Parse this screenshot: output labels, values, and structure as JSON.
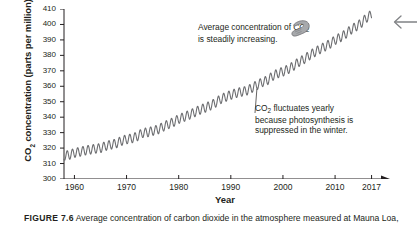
{
  "figure": {
    "caption_number": "FIGURE 7.6",
    "caption_text": "  Average concentration of carbon dioxide in the atmosphere measured at Mauna Loa, Hawaii."
  },
  "icons": {
    "pointing_hand": "pointing-hand-icon",
    "page_back_arrow": "left-arrow-icon"
  },
  "annotations": [
    {
      "id": "trend",
      "line1": "Average concentration of CO",
      "sub1": "2",
      "line2": "is steadily increasing."
    },
    {
      "id": "seasonal",
      "line1": "CO",
      "sub1": "2",
      "line1b": " fluctuates yearly",
      "line2": "because photosynthesis is",
      "line3": "suppressed in the winter."
    }
  ],
  "chart_data": {
    "type": "line",
    "title": "",
    "xlabel": "Year",
    "ylabel": "CO2 concentration (parts per million)",
    "ylabel_display": "CO",
    "ylabel_sub": "2",
    "ylabel_rest": " concentration (parts per million)",
    "xlim": [
      1958,
      2019
    ],
    "ylim": [
      300,
      410
    ],
    "xticks": [
      1960,
      1970,
      1980,
      1990,
      2000,
      2010,
      2017
    ],
    "yticks": [
      300,
      310,
      320,
      330,
      340,
      350,
      360,
      370,
      380,
      390,
      400,
      410
    ],
    "grid": false,
    "legend": null,
    "series_color": "#6d6e71",
    "seasonal_amplitude_ppm": 3.0,
    "x": [
      1958,
      1959,
      1960,
      1961,
      1962,
      1963,
      1964,
      1965,
      1966,
      1967,
      1968,
      1969,
      1970,
      1971,
      1972,
      1973,
      1974,
      1975,
      1976,
      1977,
      1978,
      1979,
      1980,
      1981,
      1982,
      1983,
      1984,
      1985,
      1986,
      1987,
      1988,
      1989,
      1990,
      1991,
      1992,
      1993,
      1994,
      1995,
      1996,
      1997,
      1998,
      1999,
      2000,
      2001,
      2002,
      2003,
      2004,
      2005,
      2006,
      2007,
      2008,
      2009,
      2010,
      2011,
      2012,
      2013,
      2014,
      2015,
      2016,
      2017
    ],
    "values": [
      315.0,
      315.6,
      316.9,
      317.6,
      318.4,
      319.0,
      319.6,
      320.0,
      321.4,
      322.2,
      323.0,
      324.6,
      325.7,
      326.3,
      327.5,
      329.7,
      330.2,
      331.1,
      332.0,
      333.8,
      335.4,
      336.8,
      338.8,
      340.1,
      341.5,
      343.1,
      344.7,
      346.0,
      347.4,
      349.2,
      351.6,
      353.1,
      354.4,
      355.6,
      356.4,
      357.1,
      358.8,
      360.8,
      362.6,
      363.8,
      366.6,
      368.3,
      369.5,
      371.0,
      373.1,
      375.6,
      377.4,
      379.8,
      381.9,
      383.8,
      385.6,
      387.4,
      389.9,
      391.6,
      393.8,
      396.5,
      398.6,
      400.8,
      404.2,
      406.5
    ]
  }
}
